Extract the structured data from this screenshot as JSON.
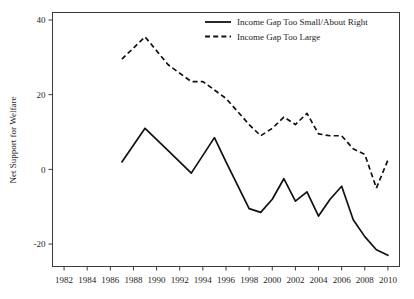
{
  "chart_data": {
    "type": "line",
    "title": "",
    "xlabel": "",
    "ylabel": "Net Support for Welfare",
    "xlim": [
      1981,
      2011
    ],
    "ylim": [
      -26,
      42
    ],
    "grid": false,
    "legend_position": "top-right",
    "xticks": [
      1982,
      1984,
      1986,
      1988,
      1990,
      1992,
      1994,
      1996,
      1998,
      2000,
      2002,
      2004,
      2006,
      2008,
      2010
    ],
    "yticks": [
      40,
      20,
      0,
      -20
    ],
    "series": [
      {
        "name": "Income Gap Too Small/About Right",
        "style": "solid",
        "color": "#111111",
        "x": [
          1987,
          1989,
          1991,
          1993,
          1995,
          1996,
          1998,
          1999,
          2000,
          2001,
          2002,
          2003,
          2004,
          2005,
          2006,
          2007,
          2008,
          2009,
          2010
        ],
        "values": [
          2.0,
          11.0,
          5.0,
          -1.0,
          8.5,
          2.0,
          -10.5,
          -11.5,
          -8.0,
          -2.5,
          -8.5,
          -6.0,
          -12.5,
          -8.0,
          -4.5,
          -13.5,
          -18.0,
          -21.5,
          -23.0
        ]
      },
      {
        "name": "Income Gap Too Large",
        "style": "dashed",
        "color": "#111111",
        "x": [
          1987,
          1989,
          1991,
          1993,
          1994,
          1996,
          1998,
          1999,
          2000,
          2001,
          2002,
          2003,
          2004,
          2005,
          2006,
          2007,
          2008,
          2009,
          2010
        ],
        "values": [
          29.5,
          35.5,
          28.0,
          23.5,
          23.5,
          19.0,
          12.0,
          9.0,
          11.0,
          14.0,
          12.0,
          15.0,
          9.5,
          9.0,
          9.0,
          5.5,
          4.0,
          -5.0,
          2.5
        ]
      }
    ]
  },
  "legend": {
    "items": [
      {
        "label": "Income Gap Too Small/About Right",
        "style": "solid"
      },
      {
        "label": "Income Gap Too Large",
        "style": "dashed"
      }
    ]
  },
  "axis": {
    "y_title": "Net Support for Welfare",
    "y_tick_labels": [
      "40",
      "20",
      "0",
      "-20"
    ],
    "x_tick_labels": [
      "1982",
      "1984",
      "1986",
      "1988",
      "1990",
      "1992",
      "1994",
      "1996",
      "1998",
      "2000",
      "2002",
      "2004",
      "2006",
      "2008",
      "2010"
    ]
  }
}
